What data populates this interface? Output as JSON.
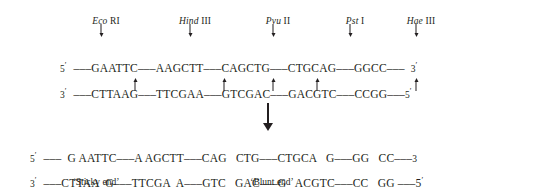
{
  "figure": {
    "type": "restriction-enzyme-cleavage-map",
    "background_color": "#ffffff",
    "text_color": "#231f20"
  },
  "enzymes": [
    {
      "genus": "Eco",
      "number": "RI",
      "site": "GAATTC",
      "cut_type": "sticky",
      "overhang": "5'",
      "x": 101
    },
    {
      "genus": "Hind",
      "number": "III",
      "site": "AAGCTT",
      "cut_type": "sticky",
      "overhang": "5'",
      "x": 190
    },
    {
      "genus": "Pvu",
      "number": "II",
      "site": "CAGCTG",
      "cut_type": "blunt",
      "overhang": "none",
      "x": 273
    },
    {
      "genus": "Pst",
      "number": "I",
      "site": "CTGCAG",
      "cut_type": "sticky",
      "overhang": "3'",
      "x": 350
    },
    {
      "genus": "Hae",
      "number": "III",
      "site": "GGCC",
      "cut_type": "blunt",
      "overhang": "none",
      "x": 416
    }
  ],
  "top_arrows": [
    {
      "name": "eco-ri-cut-arrow",
      "x": 101
    },
    {
      "name": "hind-iii-cut-arrow",
      "x": 190
    },
    {
      "name": "pvu-ii-cut-arrow",
      "x": 273
    },
    {
      "name": "pst-i-cut-arrow",
      "x": 350
    },
    {
      "name": "hae-iii-cut-arrow",
      "x": 416
    }
  ],
  "bottom_arrows": [
    {
      "name": "eco-ri-cut-arrow-lower",
      "x": 135
    },
    {
      "name": "hind-iii-cut-arrow-lower",
      "x": 224
    },
    {
      "name": "pvu-ii-cut-arrow-lower",
      "x": 273
    },
    {
      "name": "pst-i-cut-arrow-lower",
      "x": 317
    },
    {
      "name": "hae-iii-cut-arrow-lower",
      "x": 416
    }
  ],
  "uncut": {
    "top": {
      "end_label": "5",
      "end_prime": "′",
      "sequence": "–––GAATTC–––AAGCTT–––CAGCTG–––CTGCAG–––GGCC–––",
      "tail_label": "3",
      "tail_prime": "′"
    },
    "bottom": {
      "end_label": "3",
      "end_prime": "′",
      "sequence": "–––CTTAAG–––TTCGAA–––GTCGAC–––GACGTC–––CCGG–––",
      "tail_label": "5",
      "tail_prime": "′"
    }
  },
  "reaction_arrow": {
    "name": "digestion-arrow",
    "x": 268
  },
  "cut": {
    "top": {
      "end_label": "5",
      "end_prime": "′",
      "sequence": "–––  G AATTC–––A AGCTT–––CAG   CTG–––CTGCA   G–––GG   CC–––",
      "tail_label": "3",
      "tail_prime": ""
    },
    "bottom": {
      "end_label": "3",
      "end_prime": "′",
      "sequence": "–––CTTAA  G–––TTCGA  A–––GTC   GAC–––G   ACGTC–––CC   GG –––5",
      "tail_label": "",
      "tail_prime": "′"
    }
  },
  "captions": [
    {
      "name": "sticky-end-caption",
      "text": "‘Sticky end’",
      "x": 96
    },
    {
      "name": "blunt-end-caption",
      "text": "‘Blunt end’",
      "x": 272
    }
  ]
}
